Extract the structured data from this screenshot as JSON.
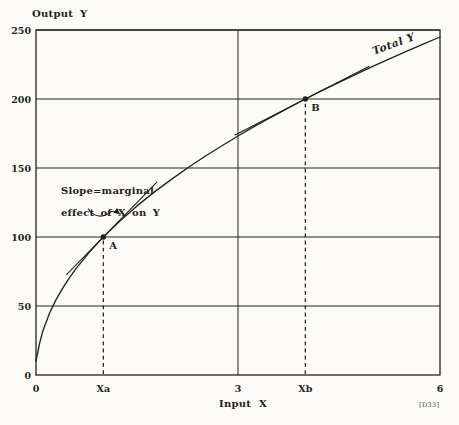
{
  "figure": {
    "tag": "[D33]",
    "paper_color": "#fbfaf7",
    "ink_color": "#222222"
  },
  "chart_data": {
    "type": "line",
    "title": "",
    "xlabel": "Input X",
    "ylabel": "Output Y",
    "xlim": [
      0,
      6
    ],
    "ylim": [
      0,
      250
    ],
    "grid": true,
    "x_gridlines": [
      3
    ],
    "y_gridlines": [
      50,
      100,
      150,
      200,
      250
    ],
    "x_ticks": [
      {
        "value": 0,
        "label": "0"
      },
      {
        "value": 1,
        "label": "Xa"
      },
      {
        "value": 3,
        "label": "3"
      },
      {
        "value": 4,
        "label": "Xb"
      },
      {
        "value": 6,
        "label": "6"
      }
    ],
    "y_ticks": [
      {
        "value": 0,
        "label": "0"
      },
      {
        "value": 50,
        "label": "50"
      },
      {
        "value": 100,
        "label": "100"
      },
      {
        "value": 150,
        "label": "150"
      },
      {
        "value": 200,
        "label": "200"
      },
      {
        "value": 250,
        "label": "250"
      }
    ],
    "series": [
      {
        "name": "Total Y",
        "formula": "Y = 100 * sqrt(X)",
        "points": [
          [
            0,
            10
          ],
          [
            0.05,
            22.4
          ],
          [
            0.1,
            31.6
          ],
          [
            0.2,
            44.7
          ],
          [
            0.3,
            54.8
          ],
          [
            0.4,
            63.2
          ],
          [
            0.5,
            70.7
          ],
          [
            0.6,
            77.5
          ],
          [
            0.8,
            89.4
          ],
          [
            1,
            100
          ],
          [
            1.25,
            111.8
          ],
          [
            1.5,
            122.5
          ],
          [
            1.75,
            132.3
          ],
          [
            2,
            141.4
          ],
          [
            2.25,
            150
          ],
          [
            2.5,
            158.1
          ],
          [
            2.75,
            165.8
          ],
          [
            3,
            173.2
          ],
          [
            3.25,
            180.3
          ],
          [
            3.5,
            187.1
          ],
          [
            3.75,
            193.6
          ],
          [
            4,
            200
          ],
          [
            4.25,
            206.2
          ],
          [
            4.5,
            212.1
          ],
          [
            4.75,
            217.9
          ],
          [
            5,
            223.6
          ],
          [
            5.25,
            229.1
          ],
          [
            5.5,
            234.5
          ],
          [
            5.75,
            239.8
          ],
          [
            6,
            244.9
          ]
        ]
      }
    ],
    "marked_points": [
      {
        "label": "A",
        "x": 1,
        "y": 100
      },
      {
        "label": "B",
        "x": 4,
        "y": 200
      }
    ],
    "tangent_lines": [
      {
        "at_point": "A",
        "slope": 50,
        "x_start": 0.45,
        "x_end": 1.8
      },
      {
        "at_point": "B",
        "slope": 25,
        "x_start": 2.95,
        "x_end": 4.95
      }
    ],
    "curve_label": {
      "text": "Total Y",
      "x": 5.02,
      "y": 232,
      "rotation_deg": -20
    },
    "annotation": {
      "line1": "Slope=marginal",
      "line2": "effect of X on Y",
      "points_to": "tangent line at point A"
    }
  }
}
